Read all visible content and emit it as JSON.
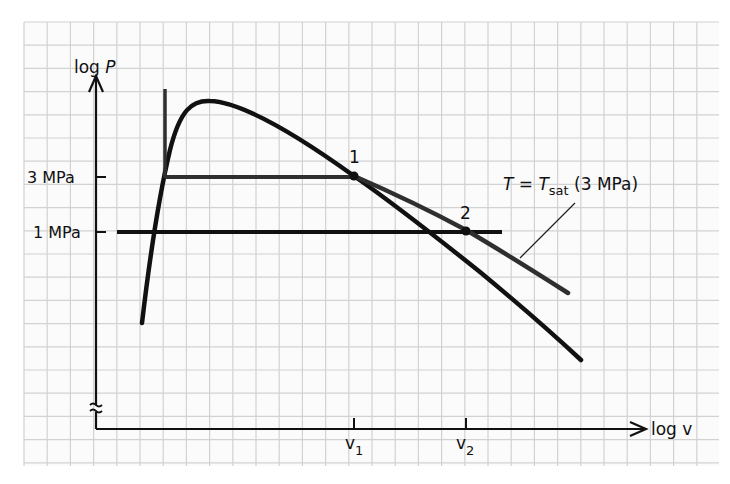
{
  "diagram": {
    "y_axis": {
      "label_main": "log ",
      "label_var": "P",
      "ticks": [
        {
          "label": "3 MPa",
          "y": 177
        },
        {
          "label": "1 MPa",
          "y": 232
        }
      ]
    },
    "x_axis": {
      "label_main": "log ",
      "label_var": "v",
      "ticks": [
        {
          "label": "v",
          "sub": "1",
          "x": 354
        },
        {
          "label": "v",
          "sub": "2",
          "x": 466
        }
      ]
    },
    "points": [
      {
        "label": "1",
        "x": 354,
        "y": 176
      },
      {
        "label": "2",
        "x": 466,
        "y": 231
      }
    ],
    "annotation": {
      "prefix": "T = T",
      "sub": "sat",
      "suffix": " (3 MPa)"
    },
    "colors": {
      "grid": "#cfcfcf",
      "background": "#fbfbfb",
      "curve": "#111111",
      "isotherm": "#2f2f2f"
    }
  }
}
